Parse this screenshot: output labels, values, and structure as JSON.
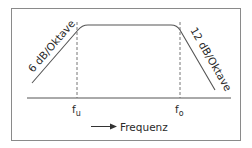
{
  "diagram": {
    "type": "band-pass frequency response",
    "left_slope_label": "6 dB/Oktave",
    "right_slope_label": "12 dB/Oktave",
    "lower_cutoff": {
      "symbol": "f",
      "subscript": "u"
    },
    "upper_cutoff": {
      "symbol": "f",
      "subscript": "o"
    },
    "axis_label": "Frequenz",
    "axis_arrow": "right-arrow"
  },
  "colors": {
    "line": "#555555",
    "border": "#8a8a8a",
    "text": "#2a2a2a"
  }
}
